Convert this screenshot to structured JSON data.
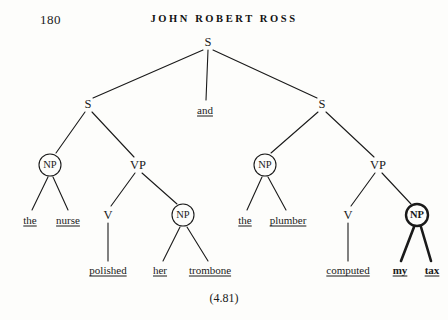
{
  "page": {
    "folio": "180",
    "running_title": "JOHN ROBERT ROSS",
    "example_number": "(4.81)",
    "ink_color": "#1a1a1a",
    "paper_color": "#fdfdfb"
  },
  "diagram": {
    "type": "syntax-tree",
    "nodes": [
      {
        "id": "s-root",
        "label": "S",
        "x": 208,
        "y": 42,
        "shape": "plain",
        "emphasis": "normal"
      },
      {
        "id": "s-left",
        "label": "S",
        "x": 88,
        "y": 104,
        "shape": "plain",
        "emphasis": "normal"
      },
      {
        "id": "s-right",
        "label": "S",
        "x": 322,
        "y": 104,
        "shape": "plain",
        "emphasis": "normal"
      },
      {
        "id": "np-1",
        "label": "NP",
        "x": 50,
        "y": 165,
        "shape": "circled",
        "emphasis": "normal"
      },
      {
        "id": "vp-1",
        "label": "VP",
        "x": 138,
        "y": 165,
        "shape": "plain",
        "emphasis": "normal"
      },
      {
        "id": "v-1",
        "label": "V",
        "x": 108,
        "y": 215,
        "shape": "plain",
        "emphasis": "normal"
      },
      {
        "id": "np-2",
        "label": "NP",
        "x": 183,
        "y": 215,
        "shape": "circled",
        "emphasis": "normal"
      },
      {
        "id": "np-3",
        "label": "NP",
        "x": 265,
        "y": 165,
        "shape": "circled",
        "emphasis": "normal"
      },
      {
        "id": "vp-2",
        "label": "VP",
        "x": 378,
        "y": 165,
        "shape": "plain",
        "emphasis": "normal"
      },
      {
        "id": "v-2",
        "label": "V",
        "x": 348,
        "y": 215,
        "shape": "plain",
        "emphasis": "normal"
      },
      {
        "id": "np-4",
        "label": "NP",
        "x": 417,
        "y": 215,
        "shape": "circled",
        "emphasis": "bold"
      }
    ],
    "leaves": [
      {
        "id": "leaf-the-1",
        "text": "the",
        "x": 30,
        "y": 220,
        "emphasis": "normal"
      },
      {
        "id": "leaf-nurse",
        "text": "nurse",
        "x": 68,
        "y": 220,
        "emphasis": "normal"
      },
      {
        "id": "leaf-and",
        "text": "and",
        "x": 205,
        "y": 110,
        "emphasis": "normal"
      },
      {
        "id": "leaf-polished",
        "text": "polished",
        "x": 108,
        "y": 270,
        "emphasis": "normal"
      },
      {
        "id": "leaf-her",
        "text": "her",
        "x": 160,
        "y": 270,
        "emphasis": "normal"
      },
      {
        "id": "leaf-trombone",
        "text": "trombone",
        "x": 210,
        "y": 270,
        "emphasis": "normal"
      },
      {
        "id": "leaf-the-2",
        "text": "the",
        "x": 245,
        "y": 220,
        "emphasis": "normal"
      },
      {
        "id": "leaf-plumber",
        "text": "plumber",
        "x": 288,
        "y": 220,
        "emphasis": "normal"
      },
      {
        "id": "leaf-computed",
        "text": "computed",
        "x": 348,
        "y": 270,
        "emphasis": "normal"
      },
      {
        "id": "leaf-my",
        "text": "my",
        "x": 400,
        "y": 270,
        "emphasis": "bold"
      },
      {
        "id": "leaf-tax",
        "text": "tax",
        "x": 432,
        "y": 270,
        "emphasis": "bold"
      }
    ],
    "edges": [
      {
        "id": "e-root-sleft",
        "x1": 203,
        "y1": 50,
        "x2": 93,
        "y2": 98,
        "emphasis": "normal"
      },
      {
        "id": "e-root-and",
        "x1": 208,
        "y1": 50,
        "x2": 206,
        "y2": 100,
        "emphasis": "normal"
      },
      {
        "id": "e-root-sright",
        "x1": 213,
        "y1": 50,
        "x2": 317,
        "y2": 98,
        "emphasis": "normal"
      },
      {
        "id": "e-sleft-np1",
        "x1": 85,
        "y1": 112,
        "x2": 56,
        "y2": 153,
        "emphasis": "normal"
      },
      {
        "id": "e-sleft-vp1",
        "x1": 92,
        "y1": 112,
        "x2": 134,
        "y2": 157,
        "emphasis": "normal"
      },
      {
        "id": "e-np1-the1",
        "x1": 48,
        "y1": 177,
        "x2": 32,
        "y2": 210,
        "emphasis": "normal"
      },
      {
        "id": "e-np1-nurse",
        "x1": 53,
        "y1": 177,
        "x2": 68,
        "y2": 210,
        "emphasis": "normal"
      },
      {
        "id": "e-vp1-v1",
        "x1": 135,
        "y1": 173,
        "x2": 111,
        "y2": 206,
        "emphasis": "normal"
      },
      {
        "id": "e-vp1-np2",
        "x1": 142,
        "y1": 173,
        "x2": 177,
        "y2": 204,
        "emphasis": "normal"
      },
      {
        "id": "e-v1-polished",
        "x1": 108,
        "y1": 223,
        "x2": 108,
        "y2": 261,
        "emphasis": "normal"
      },
      {
        "id": "e-np2-her",
        "x1": 180,
        "y1": 227,
        "x2": 163,
        "y2": 261,
        "emphasis": "normal"
      },
      {
        "id": "e-np2-trombone",
        "x1": 187,
        "y1": 227,
        "x2": 208,
        "y2": 261,
        "emphasis": "normal"
      },
      {
        "id": "e-sright-np3",
        "x1": 318,
        "y1": 112,
        "x2": 271,
        "y2": 153,
        "emphasis": "normal"
      },
      {
        "id": "e-sright-vp2",
        "x1": 326,
        "y1": 112,
        "x2": 374,
        "y2": 157,
        "emphasis": "normal"
      },
      {
        "id": "e-np3-the2",
        "x1": 262,
        "y1": 177,
        "x2": 247,
        "y2": 210,
        "emphasis": "normal"
      },
      {
        "id": "e-np3-plumber",
        "x1": 268,
        "y1": 177,
        "x2": 286,
        "y2": 210,
        "emphasis": "normal"
      },
      {
        "id": "e-vp2-v2",
        "x1": 375,
        "y1": 173,
        "x2": 351,
        "y2": 206,
        "emphasis": "normal"
      },
      {
        "id": "e-vp2-np4",
        "x1": 382,
        "y1": 173,
        "x2": 411,
        "y2": 204,
        "emphasis": "normal"
      },
      {
        "id": "e-v2-computed",
        "x1": 348,
        "y1": 223,
        "x2": 348,
        "y2": 261,
        "emphasis": "normal"
      },
      {
        "id": "e-np4-my",
        "x1": 414,
        "y1": 227,
        "x2": 401,
        "y2": 261,
        "emphasis": "bold"
      },
      {
        "id": "e-np4-tax",
        "x1": 421,
        "y1": 227,
        "x2": 431,
        "y2": 261,
        "emphasis": "bold"
      }
    ],
    "circles": [
      {
        "id": "circle-np-1",
        "cx": 50,
        "cy": 165,
        "r": 11,
        "emphasis": "normal"
      },
      {
        "id": "circle-np-2",
        "cx": 183,
        "cy": 215,
        "r": 11,
        "emphasis": "normal"
      },
      {
        "id": "circle-np-3",
        "cx": 265,
        "cy": 165,
        "r": 11,
        "emphasis": "normal"
      },
      {
        "id": "circle-np-4",
        "cx": 417,
        "cy": 215,
        "r": 11,
        "emphasis": "bold"
      }
    ]
  }
}
